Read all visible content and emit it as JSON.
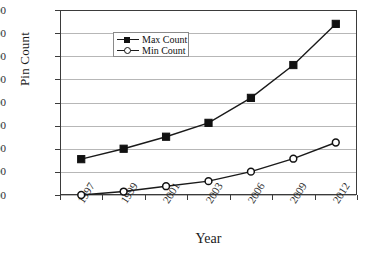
{
  "chart_data": {
    "type": "line",
    "title": "",
    "xlabel": "Year",
    "ylabel": "Pin Count",
    "categories": [
      "1997",
      "1999",
      "2001",
      "2003",
      "2006",
      "2009",
      "2012"
    ],
    "series": [
      {
        "name": "Max Count",
        "marker": "filled-square",
        "values": [
          255,
          300,
          352,
          412,
          520,
          662,
          840
        ]
      },
      {
        "name": "Min Count",
        "marker": "open-circle",
        "values": [
          100,
          115,
          138,
          160,
          201,
          257,
          327
        ]
      }
    ],
    "ylim": [
      100,
      900
    ],
    "yticks": [
      100,
      200,
      300,
      400,
      500,
      600,
      700,
      800,
      900
    ],
    "ytick_labels": [
      "100",
      "200",
      "300",
      "400",
      "500",
      "600",
      "700",
      "800",
      "900"
    ],
    "grid": "horizontal",
    "legend_position": "upper-left-inside",
    "legend_entries": [
      "Max Count",
      "Min Count"
    ],
    "colors": {
      "series": "#111111",
      "grid": "#b7b7b7",
      "axis": "#3b3b3b",
      "background": "#ffffff"
    }
  }
}
